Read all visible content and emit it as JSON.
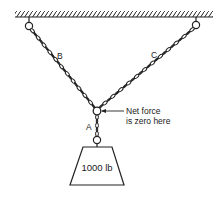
{
  "diagram": {
    "labels": {
      "chain_b": "B",
      "chain_c": "C",
      "chain_a": "A",
      "annotation_line1": "Net force",
      "annotation_line2": "is zero here",
      "weight": "1000 lb"
    },
    "colors": {
      "ink": "#222222",
      "background": "#ffffff"
    }
  }
}
